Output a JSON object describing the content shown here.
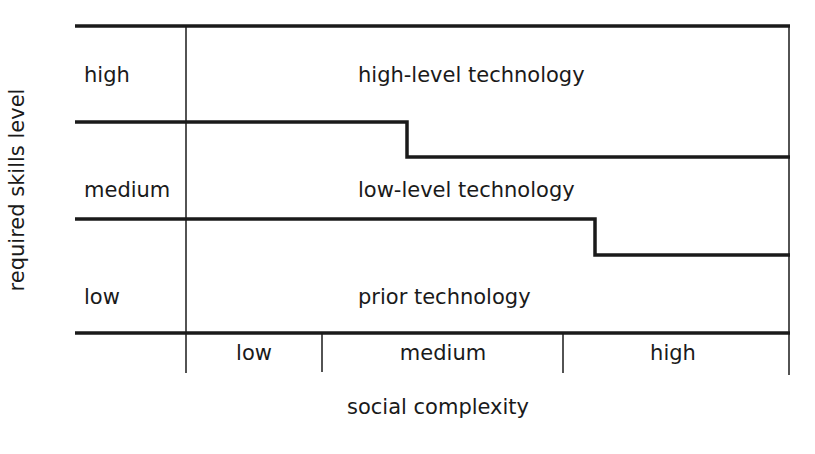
{
  "diagram": {
    "y_axis_label": "required skills level",
    "x_axis_label": "social complexity",
    "row_labels": {
      "high": "high",
      "medium": "medium",
      "low": "low"
    },
    "regions": {
      "high": "high-level technology",
      "medium": "low-level technology",
      "low": "prior technology"
    },
    "column_labels": {
      "low": "low",
      "medium": "medium",
      "high": "high"
    },
    "line_color": "#1a1a1a",
    "background_color": "#ffffff"
  }
}
